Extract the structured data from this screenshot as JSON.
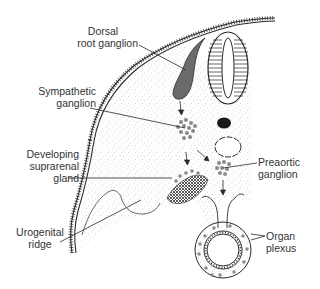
{
  "figure": {
    "type": "embryology cross-section diagram",
    "colors": {
      "ink": "#2a2a2a",
      "ganglion_fill": "#6b6b6b",
      "cell_dot": "#8a8a8a",
      "stipple": "#9a9a9a",
      "background": "#ffffff"
    }
  },
  "labels": {
    "dorsal_root_ganglion": {
      "line1": "Dorsal",
      "line2": "root ganglion"
    },
    "sympathetic_ganglion": {
      "line1": "Sympathetic",
      "line2": "ganglion"
    },
    "developing_suprarenal_gland": {
      "line1": "Developing",
      "line2": "suprarenal",
      "line3": "gland"
    },
    "urogenital_ridge": {
      "line1": "Urogenital",
      "line2": "ridge"
    },
    "preaortic_ganglion": {
      "line1": "Preaortic",
      "line2": "ganglion"
    },
    "organ_plexus": {
      "line1": "Organ",
      "line2": "plexus"
    }
  }
}
